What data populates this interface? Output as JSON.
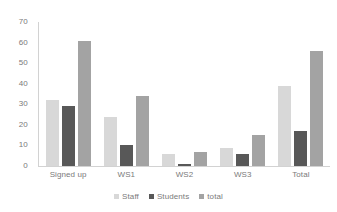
{
  "chart_data": {
    "type": "bar",
    "title": "",
    "subtitle": "",
    "xlabel": "",
    "ylabel": "",
    "ylim": [
      0,
      70
    ],
    "yticks": [
      0,
      10,
      20,
      30,
      40,
      50,
      60,
      70
    ],
    "ytick_labels": [
      "0",
      "10",
      "20",
      "30",
      "40",
      "50",
      "60",
      "70"
    ],
    "grid": false,
    "legend_position": "bottom",
    "categories": [
      "Signed up",
      "WS1",
      "WS2",
      "WS3",
      "Total"
    ],
    "series": [
      {
        "name": "Staff",
        "color": "#d8d8d8",
        "values": [
          32,
          24,
          6,
          9,
          39
        ]
      },
      {
        "name": "Students",
        "color": "#585858",
        "values": [
          29,
          10,
          1,
          6,
          17
        ]
      },
      {
        "name": "total",
        "color": "#a3a3a3",
        "values": [
          61,
          34,
          7,
          15,
          56
        ]
      }
    ]
  },
  "legend": {
    "items": [
      {
        "label": "Staff",
        "color": "#d8d8d8"
      },
      {
        "label": "Students",
        "color": "#585858"
      },
      {
        "label": "total",
        "color": "#a3a3a3"
      }
    ]
  },
  "colors": {
    "series_staff": "#d8d8d8",
    "series_students": "#585858",
    "series_total": "#a3a3a3",
    "axis": "#d2d2d2",
    "text": "#7a7a7a",
    "background": "#ffffff"
  }
}
